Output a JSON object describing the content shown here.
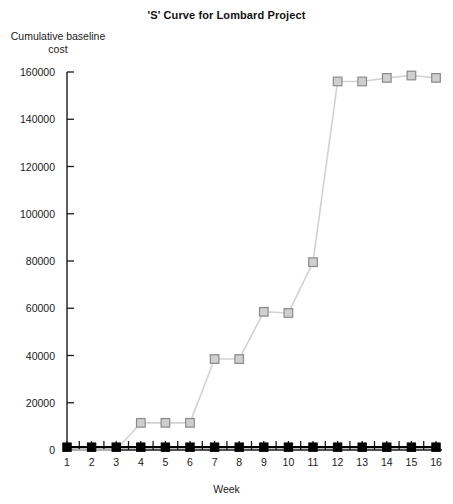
{
  "chart_data": {
    "type": "line",
    "title": "'S' Curve for Lombard Project",
    "xlabel": "Week",
    "ylabel_line1": "Cumulative baseline",
    "ylabel_line2": "cost",
    "grid": false,
    "legend": "none",
    "x": [
      1,
      2,
      3,
      4,
      5,
      6,
      7,
      8,
      9,
      10,
      11,
      12,
      13,
      14,
      15,
      16
    ],
    "categories": [
      "1",
      "2",
      "3",
      "4",
      "5",
      "6",
      "7",
      "8",
      "9",
      "10",
      "11",
      "12",
      "13",
      "14",
      "15",
      "16"
    ],
    "xlim": [
      1,
      16
    ],
    "ylim": [
      0,
      160000
    ],
    "ytick_values": [
      0,
      20000,
      40000,
      60000,
      80000,
      100000,
      120000,
      140000,
      160000
    ],
    "ytick_labels": [
      "0",
      "20000",
      "40000",
      "60000",
      "80000",
      "100000",
      "120000",
      "140000",
      "160000"
    ],
    "series": [
      {
        "name": "cumulative-baseline-cost",
        "marker": "square-open",
        "marker_fill": "#cfcfcf",
        "marker_stroke": "#8a8a8a",
        "line_color": "#d2d2d2",
        "values": [
          0,
          0,
          0,
          11500,
          11500,
          11500,
          38500,
          38500,
          58500,
          58000,
          79500,
          156000,
          156000,
          157500,
          158500,
          157500
        ]
      },
      {
        "name": "baseline-marker-series",
        "marker": "square-filled",
        "marker_fill": "#000000",
        "marker_stroke": "#000000",
        "line_color": "#000000",
        "values": [
          1200,
          1200,
          1200,
          1200,
          1200,
          1200,
          1200,
          1200,
          1200,
          1200,
          1200,
          1200,
          1200,
          1200,
          1200,
          1200
        ]
      }
    ]
  },
  "colors": {
    "axis": "#1a1a1a",
    "grey_line": "#d2d2d2",
    "grey_marker_fill": "#cfcfcf",
    "grey_marker_stroke": "#8a8a8a",
    "black_series": "#000000",
    "background": "#ffffff"
  }
}
